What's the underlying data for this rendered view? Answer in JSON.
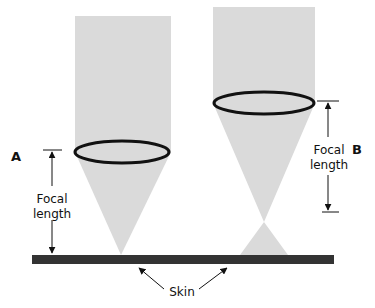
{
  "diagram": {
    "labels": {
      "a": "A",
      "b": "B",
      "focal_a_line1": "Focal",
      "focal_a_line2": "length",
      "focal_b_line1": "Focal",
      "focal_b_line2": "length",
      "skin": "Skin"
    },
    "colors": {
      "beam": "#d9d9d9",
      "lens": "#111111",
      "skin": "#333333",
      "text": "#111111"
    }
  }
}
